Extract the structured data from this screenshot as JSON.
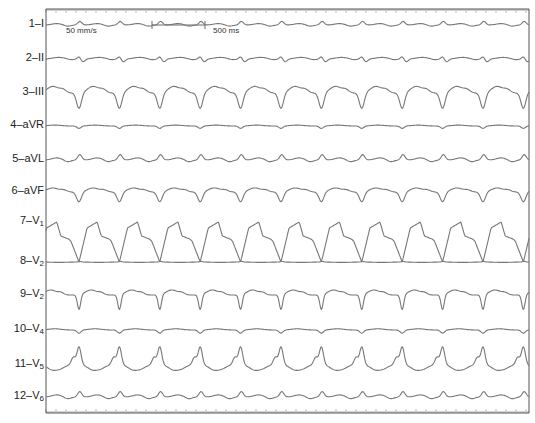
{
  "figure": {
    "type": "12-lead ECG tracing",
    "speed_label": "50 mm/s",
    "scale_bar_label": "500 ms",
    "trace_color": "#777777",
    "frame_color": "#555555"
  },
  "leads": [
    {
      "num": "1",
      "name": "I",
      "sub": "",
      "baseline": 25,
      "shape": "small_pos",
      "amp": 4
    },
    {
      "num": "2",
      "name": "II",
      "sub": "",
      "baseline": 59,
      "shape": "small_mixed",
      "amp": 4
    },
    {
      "num": "3",
      "name": "III",
      "sub": "",
      "baseline": 93,
      "shape": "neg_deep",
      "amp": 12
    },
    {
      "num": "4",
      "name": "aVR",
      "sub": "",
      "baseline": 126,
      "shape": "flat_neg",
      "amp": 3
    },
    {
      "num": "5",
      "name": "aVL",
      "sub": "",
      "baseline": 160,
      "shape": "small_pos",
      "amp": 6
    },
    {
      "num": "6",
      "name": "aVF",
      "sub": "",
      "baseline": 192,
      "shape": "neg_mid",
      "amp": 9
    },
    {
      "num": "7",
      "name": "V",
      "sub": "1",
      "baseline": 222,
      "shape": "v1",
      "amp": 40
    },
    {
      "num": "8",
      "name": "V",
      "sub": "2",
      "baseline": 262,
      "shape": "flat",
      "amp": 2
    },
    {
      "num": "9",
      "name": "V",
      "sub": "2",
      "baseline": 295,
      "shape": "neg_sharp",
      "amp": 10
    },
    {
      "num": "10",
      "name": "V",
      "sub": "4",
      "baseline": 330,
      "shape": "flat_neg",
      "amp": 4
    },
    {
      "num": "11",
      "name": "V",
      "sub": "5",
      "baseline": 365,
      "shape": "v5",
      "amp": 14
    },
    {
      "num": "12",
      "name": "V",
      "sub": "6",
      "baseline": 397,
      "shape": "small_pos",
      "amp": 6
    }
  ],
  "layout": {
    "plot_left": 46,
    "plot_right": 529,
    "top_ruler_y": 9,
    "bottom_ruler_y": 413,
    "beat_period_px": 40.4,
    "first_beat_x": 79
  }
}
